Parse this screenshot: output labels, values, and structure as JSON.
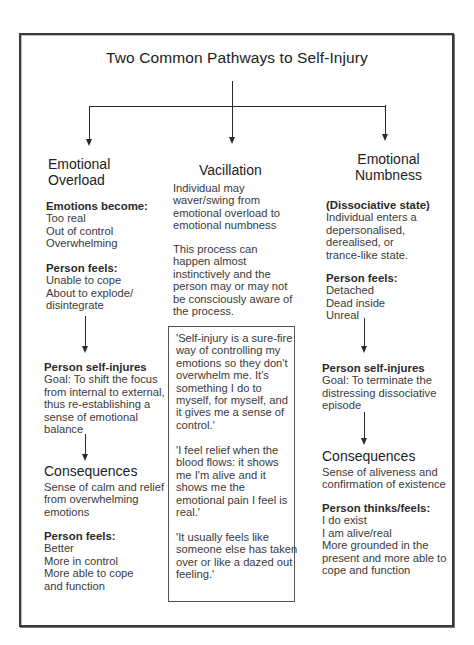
{
  "title": "Two Common Pathways to Self-Injury",
  "colors": {
    "ink": "#2a2a2a",
    "frame": "#3a3a3a",
    "background": "#ffffff"
  },
  "left": {
    "heading": [
      "Emotional",
      "Overload"
    ],
    "emotions": {
      "label": "Emotions become:",
      "items": [
        "Too real",
        "Out of control",
        "Overwhelming"
      ]
    },
    "feels": {
      "label": "Person feels:",
      "items": [
        "Unable to cope",
        "About to explode/",
        "disintegrate"
      ]
    },
    "self_injures": {
      "label": "Person self-injures",
      "lines": [
        "Goal: To shift the focus",
        "from internal to external,",
        "thus re-establishing a",
        "sense of emotional",
        "balance"
      ]
    },
    "consequences": {
      "label": "Consequences",
      "lines": [
        "Sense of calm and relief",
        "from overwhelming",
        "emotions"
      ]
    },
    "after_feels": {
      "label": "Person feels:",
      "items": [
        "Better",
        "More in control",
        "More able to cope",
        "and function"
      ]
    }
  },
  "middle": {
    "heading": "Vacillation",
    "para1": [
      "Individual may",
      "waver/swing from",
      "emotional overload to",
      "emotional numbness"
    ],
    "para2": [
      "This process can",
      "happen almost",
      "instinctively and the",
      "person may or may not",
      "be consciously aware of",
      "the process."
    ],
    "quotes": [
      [
        "'Self-injury is a sure-fire",
        "way of controlling my",
        "emotions so they don't",
        "overwhelm me.  It's",
        "something I do to",
        "myself, for myself, and",
        "it gives me a sense of",
        "control.'"
      ],
      [
        "'I feel relief when the",
        "blood flows: it shows",
        "me I'm alive and it",
        "shows me the",
        "emotional pain I feel is",
        "real.'"
      ],
      [
        "'It usually feels like",
        "someone else has taken",
        "over or like a dazed out",
        "feeling.'"
      ]
    ]
  },
  "right": {
    "heading": [
      "Emotional",
      "Numbness"
    ],
    "dissociative": {
      "label": "(Dissociative state)",
      "lines": [
        "Individual enters a",
        "depersonalised,",
        "derealised, or",
        "trance-like state."
      ]
    },
    "feels": {
      "label": "Person feels:",
      "items": [
        "Detached",
        "Dead inside",
        "Unreal"
      ]
    },
    "self_injures": {
      "label": "Person self-injures",
      "lines": [
        "Goal: To terminate the",
        "distressing dissociative",
        "episode"
      ]
    },
    "consequences": {
      "label": "Consequences",
      "lines": [
        "Sense of aliveness and",
        "confirmation of existence"
      ]
    },
    "after_feels": {
      "label": "Person thinks/feels:",
      "items": [
        "I do exist",
        "I am alive/real",
        "More grounded in the",
        "present and more able to",
        "cope and function"
      ]
    }
  }
}
